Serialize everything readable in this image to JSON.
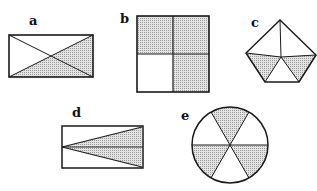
{
  "figures": {
    "a": {
      "label": "a",
      "shape": "rectangle",
      "divisions": 4,
      "shaded": 2,
      "description": "rectangle divided by both diagonals; bottom and right triangles shaded"
    },
    "b": {
      "label": "b",
      "shape": "square",
      "divisions": 4,
      "shaded": 3,
      "description": "square divided into 4 quarters; top-left, top-right, bottom-right shaded"
    },
    "c": {
      "label": "c",
      "shape": "pentagon",
      "divisions": 5,
      "shaded": 2,
      "description": "pentagon divided from center into 5 triangles; lower-left and lower-right triangles shaded"
    },
    "d": {
      "label": "d",
      "shape": "rectangle",
      "divisions": 4,
      "shaded": 2,
      "description": "rectangle with lines from left midpoint to right corners and right midpoint; middle wedge shaded"
    },
    "e": {
      "label": "e",
      "shape": "circle",
      "divisions": 6,
      "shaded": 3,
      "description": "circle divided into 6 equal sectors; alternating sectors shaded"
    }
  },
  "colors": {
    "stroke": "#1a1a1a",
    "shade": "#c8c8c8",
    "background": "#ffffff"
  }
}
